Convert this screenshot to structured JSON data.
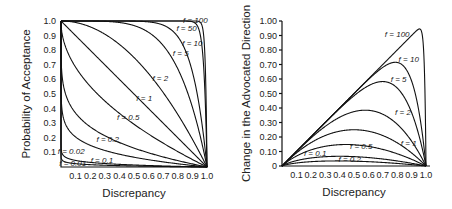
{
  "chart_data": [
    {
      "type": "line",
      "title": "",
      "xlabel": "Discrepancy",
      "ylabel": "Probability of Acceptance",
      "xlim": [
        0,
        1.0
      ],
      "ylim": [
        0,
        1.0
      ],
      "grid": false,
      "legend": "inline labels",
      "x_ticks": [
        "0.1",
        "0.2",
        "0.3",
        "0.4",
        "0.5",
        "0.6",
        "0.7",
        "0.8",
        "0.9",
        "1.0"
      ],
      "y_ticks": [
        "0.1",
        "0.2",
        "0.3",
        "0.4",
        "0.5",
        "0.6",
        "0.7",
        "0.8",
        "0.9",
        "1.0"
      ],
      "formula": "P = 1 - d^f",
      "series": [
        {
          "name": "f = 100",
          "f": 100,
          "label_pos": [
            0.92,
            1.01
          ]
        },
        {
          "name": "f = 50",
          "f": 50,
          "label_pos": [
            0.86,
            0.95
          ]
        },
        {
          "name": "f = 10",
          "f": 10,
          "label_pos": [
            0.9,
            0.85
          ]
        },
        {
          "name": "f = 5",
          "f": 5,
          "label_pos": [
            0.82,
            0.78
          ]
        },
        {
          "name": "f = 2",
          "f": 2,
          "label_pos": [
            0.68,
            0.61
          ]
        },
        {
          "name": "f = 1",
          "f": 1,
          "label_pos": [
            0.57,
            0.47
          ]
        },
        {
          "name": "f = 0.5",
          "f": 0.5,
          "label_pos": [
            0.46,
            0.34
          ]
        },
        {
          "name": "f = 0.2",
          "f": 0.2,
          "label_pos": [
            0.32,
            0.19
          ]
        },
        {
          "name": "f = 0.1",
          "f": 0.1,
          "label_pos": [
            0.28,
            0.05
          ]
        },
        {
          "name": "f = 0.02",
          "f": 0.02,
          "label_pos": [
            0.07,
            0.11
          ]
        },
        {
          "name": "f = 0.01",
          "f": 0.01,
          "label_pos": [
            0.08,
            0.03
          ]
        }
      ]
    },
    {
      "type": "line",
      "title": "",
      "xlabel": "Discrepancy",
      "ylabel": "Change in the Advocated Direction",
      "xlim": [
        0,
        1.0
      ],
      "ylim": [
        0,
        1.0
      ],
      "grid": false,
      "legend": "inline labels",
      "x_ticks": [
        "0.1",
        "0.2",
        "0.3",
        "0.4",
        "0.5",
        "0.6",
        "0.7",
        "0.8",
        "0.9",
        "1.0"
      ],
      "y_ticks": [
        "0",
        "0.10",
        "0.20",
        "0.30",
        "0.40",
        "0.50",
        "0.60",
        "0.70",
        "0.80",
        "0.90",
        "1.00"
      ],
      "formula": "C = d * (1 - d^f)",
      "series": [
        {
          "name": "f = 100",
          "f": 100,
          "peak": [
            0.96,
            0.95
          ],
          "label_pos": [
            0.8,
            0.91
          ]
        },
        {
          "name": "f = 10",
          "f": 10,
          "peak": [
            0.79,
            0.71
          ],
          "label_pos": [
            0.88,
            0.74
          ]
        },
        {
          "name": "f = 5",
          "f": 5,
          "peak": [
            0.7,
            0.58
          ],
          "label_pos": [
            0.81,
            0.6
          ]
        },
        {
          "name": "f = 2",
          "f": 2,
          "peak": [
            0.58,
            0.38
          ],
          "label_pos": [
            0.84,
            0.37
          ]
        },
        {
          "name": "f = 1",
          "f": 1,
          "peak": [
            0.5,
            0.25
          ],
          "label_pos": [
            0.88,
            0.16
          ]
        },
        {
          "name": "f = 0.5",
          "f": 0.5,
          "peak": [
            0.3,
            0.15
          ],
          "label_pos": [
            0.55,
            0.14
          ]
        },
        {
          "name": "f = 0.2",
          "f": 0.2,
          "peak": [
            0.12,
            0.07
          ],
          "label_pos": [
            0.47,
            0.05
          ]
        },
        {
          "name": "f = 0.1",
          "f": 0.1,
          "peak": [
            0.06,
            0.04
          ],
          "label_pos": [
            0.23,
            0.09
          ]
        }
      ]
    }
  ]
}
